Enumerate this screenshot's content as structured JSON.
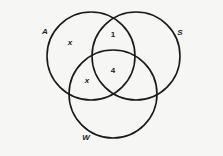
{
  "diagram": {
    "type": "venn",
    "stroke_color": "#1a1a1a",
    "background": "#f6f6f4",
    "sets": [
      {
        "id": "A",
        "label": "A",
        "cx": 91,
        "cy": 56,
        "r": 44,
        "label_x": 45,
        "label_y": 32
      },
      {
        "id": "S",
        "label": "S",
        "cx": 136,
        "cy": 56,
        "r": 44,
        "label_x": 180,
        "label_y": 33
      },
      {
        "id": "W",
        "label": "W",
        "cx": 113,
        "cy": 94,
        "r": 44,
        "label_x": 86,
        "label_y": 138
      }
    ],
    "regions": [
      {
        "id": "A_only",
        "label": "x",
        "x": 70,
        "y": 43
      },
      {
        "id": "A_and_S_only",
        "label": "1",
        "x": 113,
        "y": 35
      },
      {
        "id": "A_S_W",
        "label": "4",
        "x": 113,
        "y": 71
      },
      {
        "id": "A_and_W_only",
        "label": "x",
        "x": 87,
        "y": 81
      }
    ]
  }
}
